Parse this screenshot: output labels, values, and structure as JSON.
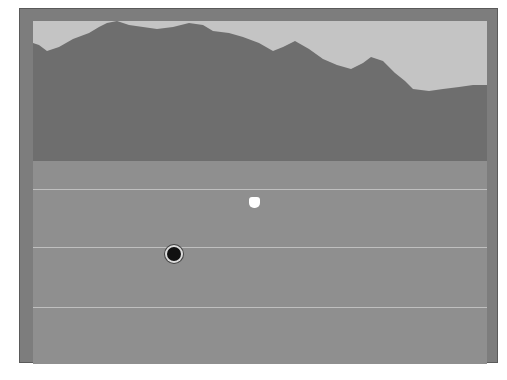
{
  "scene": {
    "type": "first-person-landscape",
    "colors": {
      "frame": "#7d7d7d",
      "sky": "#c4c4c4",
      "mountains": "#6e6e6e",
      "ground": "#8f8f8f",
      "horizon_lines": "#c8c8c8"
    },
    "horizon_lines_y": [
      180,
      238,
      298
    ],
    "markers": [
      {
        "name": "white-blob-marker",
        "x": 222,
        "y": 182
      },
      {
        "name": "target-marker",
        "x": 141,
        "y": 234
      }
    ]
  },
  "caption": {
    "text": ""
  }
}
